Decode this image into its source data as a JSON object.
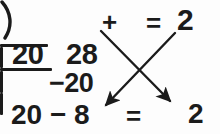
{
  "figure": {
    "ink_color": "#1b1b1b",
    "background_color": "#fdfdfd"
  },
  "long_division": {
    "divisor": "20",
    "dividend": "28",
    "quotient": "1",
    "bracket_glyph": ")",
    "subtract_row": "−20",
    "remainder_expression": "20 − 8"
  },
  "equation_top": {
    "plus": "+",
    "addend": "1",
    "equals": "=",
    "result": "2"
  },
  "equation_bottom": {
    "equals": "=",
    "result_first_digit": "1",
    "result_second_digit": "2",
    "result": "12"
  },
  "arrows": {
    "left_to_right": {
      "label": "arrow-from-quotient-to-bottom-right",
      "start_x": 101,
      "start_y": 31,
      "end_x": 173,
      "end_y": 104
    },
    "right_to_left": {
      "label": "arrow-from-result-2-to-bottom-left",
      "start_x": 175,
      "start_y": 33,
      "end_x": 102,
      "end_y": 108
    },
    "crossing_point_x": 138,
    "crossing_point_y": 68,
    "stroke_color": "#1b1b1b",
    "stroke_width": 2.4
  }
}
